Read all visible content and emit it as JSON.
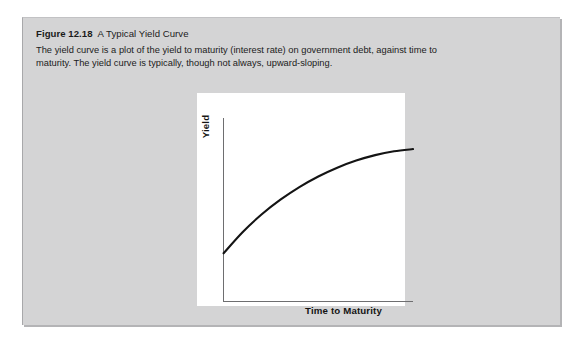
{
  "figure": {
    "number": "Figure 12.18",
    "name": "A Typical Yield Curve",
    "description": "The yield curve is a plot of the yield to maturity (interest rate) on government debt, against time to maturity. The yield curve is typically, though not always, upward-sloping.",
    "background_color": "#d4d4d5",
    "panel_color": "#ffffff"
  },
  "chart_data": {
    "type": "line",
    "title": "A Typical Yield Curve",
    "xlabel": "Time to Maturity",
    "ylabel": "Yield",
    "grid": false,
    "legend": null,
    "axis_color": "#6e6e70",
    "line_color": "#141414",
    "xlim": [
      0,
      10
    ],
    "ylim": [
      0,
      10
    ],
    "x_ticks": [],
    "y_ticks": [],
    "series": [
      {
        "name": "Yield curve",
        "shape": "concave-down increasing",
        "x": [
          0.0,
          1.0,
          2.0,
          3.0,
          4.0,
          5.0,
          6.0,
          7.0,
          8.0,
          9.0,
          10.0
        ],
        "y": [
          2.6,
          3.75,
          4.72,
          5.53,
          6.22,
          6.8,
          7.28,
          7.67,
          7.97,
          8.18,
          8.3
        ]
      }
    ],
    "annotations": []
  }
}
